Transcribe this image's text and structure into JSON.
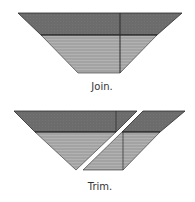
{
  "figures": [
    {
      "id": "join",
      "caption": "Join."
    },
    {
      "id": "trim",
      "caption": "Trim."
    }
  ],
  "colors": {
    "top_band": "#6c6c6c",
    "bottom_band": "#a3a3a3",
    "stripe": "#b4b4b4",
    "line": "#2a2a2a"
  }
}
